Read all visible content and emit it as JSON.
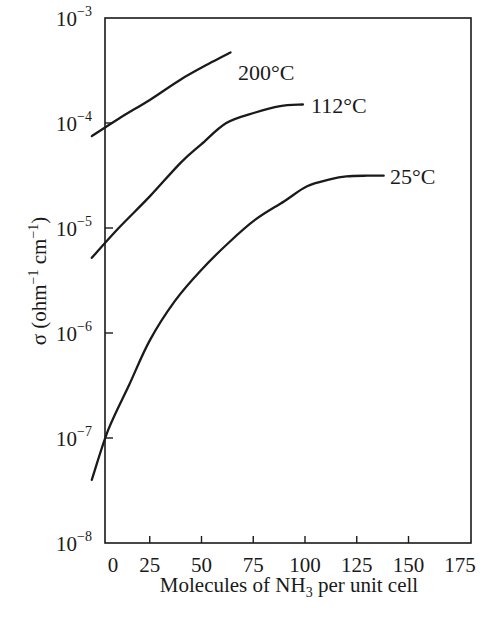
{
  "chart_data": {
    "type": "line",
    "title": "",
    "xlabel": "Molecules of NH3 per unit cell",
    "xlabel_parts": {
      "pre": "Molecules of NH",
      "sub": "3",
      "post": " per unit cell"
    },
    "ylabel": "σ (ohm⁻¹ cm⁻¹)",
    "ylabel_parts": {
      "sigma": "σ",
      "open": " (ohm",
      "exp1": "−1",
      "mid": " cm",
      "exp2": "−1",
      "close": ")"
    },
    "yscale": "log",
    "xlim": [
      -3,
      177
    ],
    "ylim": [
      1e-08,
      0.001
    ],
    "grid": false,
    "legend": "inline labels at curve ends",
    "x_ticks": [
      0,
      25,
      50,
      75,
      100,
      125,
      150,
      175
    ],
    "x_tick_labels": [
      "0",
      "25",
      "50",
      "75",
      "100",
      "125",
      "150",
      "175"
    ],
    "y_ticks": [
      1e-08,
      1e-07,
      1e-06,
      1e-05,
      0.0001,
      0.001
    ],
    "y_tick_labels": [
      {
        "base": "10",
        "exp": "−8"
      },
      {
        "base": "10",
        "exp": "−7"
      },
      {
        "base": "10",
        "exp": "−6"
      },
      {
        "base": "10",
        "exp": "−5"
      },
      {
        "base": "10",
        "exp": "−4"
      },
      {
        "base": "10",
        "exp": "−3"
      }
    ],
    "series": [
      {
        "name": "200°C",
        "label": "200°C",
        "x": [
          -3,
          10,
          25,
          40,
          55,
          64
        ],
        "y": [
          7.5e-05,
          0.00011,
          0.000166,
          0.00026,
          0.00038,
          0.00047
        ]
      },
      {
        "name": "112°C",
        "label": "112°C",
        "x": [
          -3,
          10,
          25,
          40,
          50,
          62,
          76,
          88,
          99
        ],
        "y": [
          5.2e-06,
          1e-05,
          2e-05,
          4.2e-05,
          6.3e-05,
          0.0001,
          0.000126,
          0.000145,
          0.00015
        ]
      },
      {
        "name": "25°C",
        "label": "25°C",
        "x": [
          -3,
          5,
          15,
          25,
          37,
          50,
          63,
          76,
          90,
          101,
          112,
          120,
          130,
          138
        ],
        "y": [
          4e-08,
          1.2e-07,
          3.2e-07,
          8.5e-07,
          2e-06,
          4e-06,
          7.2e-06,
          1.2e-05,
          1.8e-05,
          2.5e-05,
          2.9e-05,
          3.1e-05,
          3.15e-05,
          3.15e-05
        ]
      }
    ]
  },
  "layout": {
    "plot": {
      "left": 105,
      "top": 18,
      "right": 471,
      "bottom": 543
    },
    "x_origin_px": 98,
    "px_per_x_unit": 2.07,
    "px_per_decade": 105,
    "line_color": "#1a1a1a"
  }
}
